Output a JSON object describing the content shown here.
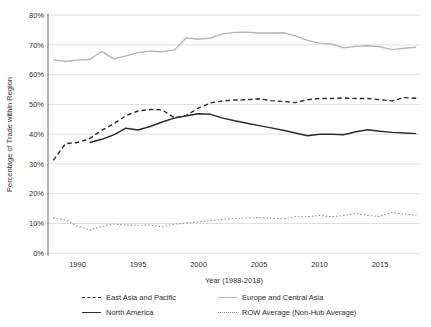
{
  "chart_data": {
    "type": "line",
    "title": "",
    "xlabel": "Year (1988-2018)",
    "ylabel": "Percentage of Trade within Region",
    "x": [
      1988,
      1989,
      1990,
      1991,
      1992,
      1993,
      1994,
      1995,
      1996,
      1997,
      1998,
      1999,
      2000,
      2001,
      2002,
      2003,
      2004,
      2005,
      2006,
      2007,
      2008,
      2009,
      2010,
      2011,
      2012,
      2013,
      2014,
      2015,
      2016,
      2017,
      2018
    ],
    "xlim": [
      1987.6,
      2018.3
    ],
    "ylim": [
      0,
      80
    ],
    "yticks": [
      0,
      10,
      20,
      30,
      40,
      50,
      60,
      70,
      80
    ],
    "ytick_suffix": "%",
    "xticks": [
      1990,
      1995,
      2000,
      2005,
      2010,
      2015
    ],
    "grid": "horizontal",
    "legend_position": "bottom",
    "series": [
      {
        "id": "east-asia-pacific",
        "name": "East Asia and Pacific",
        "line_style": "dashed",
        "color": "#2b2b2b",
        "values": [
          31.2,
          36.8,
          37.2,
          38.5,
          41.3,
          43.5,
          46.2,
          47.8,
          48.3,
          48.2,
          45.5,
          46.3,
          48.8,
          50.5,
          51.2,
          51.5,
          51.6,
          51.9,
          51.3,
          51.0,
          50.6,
          51.6,
          52.0,
          52.0,
          52.2,
          52.0,
          52.0,
          51.6,
          51.2,
          52.3,
          52.1
        ]
      },
      {
        "id": "europe-central-asia",
        "name": "Europe and Central Asia",
        "line_style": "solid",
        "color": "#b6b6b6",
        "values": [
          65.0,
          64.4,
          64.9,
          65.1,
          67.8,
          65.3,
          66.3,
          67.4,
          67.9,
          67.7,
          68.3,
          72.4,
          71.9,
          72.3,
          73.7,
          74.2,
          74.3,
          74.0,
          74.0,
          74.1,
          73.0,
          71.5,
          70.6,
          70.3,
          69.0,
          69.5,
          69.7,
          69.4,
          68.4,
          68.9,
          69.2
        ]
      },
      {
        "id": "north-america",
        "name": "North America",
        "line_style": "solid",
        "color": "#2b2b2b",
        "values": [
          null,
          null,
          null,
          37.2,
          38.3,
          39.8,
          42.0,
          41.4,
          42.6,
          44.1,
          45.4,
          46.2,
          46.9,
          46.7,
          45.4,
          44.5,
          43.7,
          42.9,
          42.1,
          41.3,
          40.4,
          39.5,
          40.0,
          40.0,
          39.8,
          40.8,
          41.5,
          41.0,
          40.6,
          40.4,
          40.2
        ]
      },
      {
        "id": "row-average",
        "name": "ROW Average (Non-Hub Average)",
        "line_style": "dotted",
        "color": "#8a8a8a",
        "values": [
          11.9,
          11.2,
          9.2,
          7.8,
          9.0,
          9.8,
          9.5,
          9.4,
          9.5,
          8.9,
          9.8,
          10.2,
          10.5,
          11.0,
          11.4,
          11.7,
          11.9,
          12.0,
          11.8,
          11.6,
          12.3,
          12.3,
          12.7,
          12.3,
          12.7,
          13.4,
          12.7,
          12.4,
          13.7,
          13.2,
          12.8
        ]
      }
    ]
  },
  "colors": {
    "grid": "#dcdcdc",
    "axis": "#666666",
    "text": "#333333",
    "background": "#ffffff"
  }
}
